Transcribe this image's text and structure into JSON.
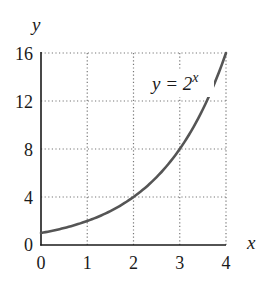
{
  "chart_data": {
    "type": "line",
    "title": "",
    "xlabel": "x",
    "ylabel": "y",
    "xlim": [
      0,
      4
    ],
    "ylim": [
      0,
      16
    ],
    "x_ticks": [
      "0",
      "1",
      "2",
      "3",
      "4"
    ],
    "y_ticks": [
      "0",
      "4",
      "8",
      "12",
      "16"
    ],
    "grid": true,
    "grid_style": "dotted",
    "legend": null,
    "annotations": [
      {
        "text": "y = 2",
        "superscript": "x",
        "position": "upper-middle-right"
      }
    ],
    "series": [
      {
        "name": "y = 2^x",
        "x": [
          0,
          0.5,
          1,
          1.5,
          2,
          2.5,
          3,
          3.5,
          4
        ],
        "values": [
          1,
          1.41,
          2,
          2.83,
          4,
          5.66,
          8,
          11.31,
          16
        ]
      }
    ]
  },
  "axes": {
    "x_label": "x",
    "y_label": "y",
    "x_ticks": [
      "0",
      "1",
      "2",
      "3",
      "4"
    ],
    "y_ticks": [
      "0",
      "4",
      "8",
      "12",
      "16"
    ]
  },
  "annotation": {
    "base": "y = 2",
    "exponent": "x"
  },
  "colors": {
    "curve": "#555555",
    "axis": "#1a1a1a",
    "grid": "#777777",
    "text": "#1a1a1a"
  }
}
